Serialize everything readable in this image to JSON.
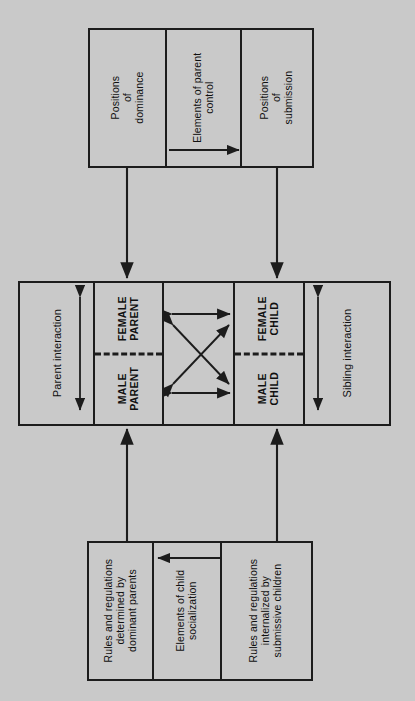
{
  "diagram": {
    "background_color": "#c9c9c9",
    "line_color": "#1c1c1c"
  },
  "top_box": {
    "name": "parent-control-box",
    "cells": [
      {
        "id": "positions-of-dominance",
        "label": "Positions\nof\ndominance"
      },
      {
        "id": "elements-of-parent-control",
        "label": "Elements of parent\ncontrol"
      },
      {
        "id": "positions-of-submission",
        "label": "Positions\nof\nsubmission"
      }
    ],
    "inner_arrow": {
      "id": "parent-control-arrow",
      "direction": "dominance-to-submission",
      "heads": 1
    }
  },
  "middle_box": {
    "name": "family-members-box",
    "left_label": "Parent interaction",
    "right_label": "Sibling interaction",
    "parents": {
      "female": "FEMALE\nPARENT",
      "male": "MALE\nPARENT"
    },
    "children": {
      "female": "FEMALE\nCHILD",
      "male": "MALE\nCHILD"
    },
    "interaction_arrows": {
      "id": "cross-interaction-arrows",
      "count": 4,
      "kinds": [
        "top-horizontal",
        "bottom-horizontal",
        "diagonal-down",
        "diagonal-up"
      ],
      "heads": 2
    },
    "side_arrows": {
      "parent": {
        "id": "parent-interaction-arrow",
        "heads": 2,
        "orientation": "vertical"
      },
      "sibling": {
        "id": "sibling-interaction-arrow",
        "heads": 2,
        "orientation": "vertical"
      }
    }
  },
  "bottom_box": {
    "name": "child-socialization-box",
    "cells": [
      {
        "id": "rules-determined-by-parents",
        "label": "Rules and regulations\ndetermined by\ndominant parents"
      },
      {
        "id": "elements-of-child-socialization",
        "label": "Elements of child\nsocialization"
      },
      {
        "id": "rules-internalized-by-children",
        "label": "Rules and regulations\ninternalized by\nsubmissive children"
      }
    ],
    "inner_arrow": {
      "id": "child-socialization-arrow",
      "direction": "children-to-parents",
      "heads": 1
    }
  },
  "connectors": [
    {
      "id": "connector-top-left",
      "from": "top_box",
      "to": "middle_box",
      "direction": "down"
    },
    {
      "id": "connector-top-right",
      "from": "top_box",
      "to": "middle_box",
      "direction": "down"
    },
    {
      "id": "connector-bottom-left",
      "from": "bottom_box",
      "to": "middle_box",
      "direction": "up"
    },
    {
      "id": "connector-bottom-right",
      "from": "bottom_box",
      "to": "middle_box",
      "direction": "up"
    }
  ]
}
